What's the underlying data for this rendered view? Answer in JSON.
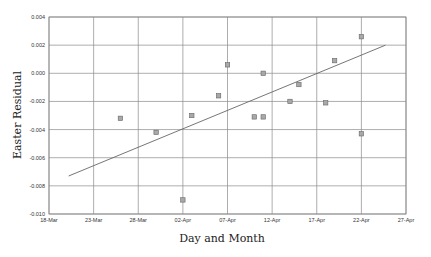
{
  "chart_data": {
    "type": "scatter",
    "title": "",
    "xlabel": "Day and Month",
    "ylabel": "Easter Residual",
    "x_tick_labels": [
      "18-Mar",
      "23-Mar",
      "28-Mar",
      "02-Apr",
      "07-Apr",
      "12-Apr",
      "17-Apr",
      "22-Apr",
      "27-Apr"
    ],
    "y_tick_labels": [
      "0.004",
      "0.002",
      "0.000",
      "-0.002",
      "-0.004",
      "-0.006",
      "-0.008",
      "-0.010"
    ],
    "ylim": [
      -0.01,
      0.004
    ],
    "xlim_days_from_18_mar": [
      0,
      40
    ],
    "grid": true,
    "legend": null,
    "series": [
      {
        "name": "Easter residuals",
        "kind": "points",
        "marker": "square",
        "points": [
          {
            "date": "26-Mar",
            "day": 8,
            "y": -0.0032
          },
          {
            "date": "30-Mar",
            "day": 12,
            "y": -0.0042
          },
          {
            "date": "02-Apr",
            "day": 15,
            "y": -0.009
          },
          {
            "date": "03-Apr",
            "day": 16,
            "y": -0.003
          },
          {
            "date": "06-Apr",
            "day": 19,
            "y": -0.0016
          },
          {
            "date": "07-Apr",
            "day": 20,
            "y": 0.0006
          },
          {
            "date": "10-Apr",
            "day": 23,
            "y": -0.0031
          },
          {
            "date": "11-Apr",
            "day": 24,
            "y": -0.0031
          },
          {
            "date": "11-Apr",
            "day": 24,
            "y": 0.0
          },
          {
            "date": "14-Apr",
            "day": 27,
            "y": -0.002
          },
          {
            "date": "15-Apr",
            "day": 28,
            "y": -0.0008
          },
          {
            "date": "18-Apr",
            "day": 31,
            "y": -0.0021
          },
          {
            "date": "19-Apr",
            "day": 32,
            "y": 0.0009
          },
          {
            "date": "22-Apr",
            "day": 35,
            "y": 0.0026
          },
          {
            "date": "22-Apr",
            "day": 35,
            "y": -0.0043
          }
        ]
      },
      {
        "name": "Fitted trend",
        "kind": "line",
        "points": [
          {
            "day": 2.2,
            "y": -0.0073
          },
          {
            "day": 37.7,
            "y": 0.002
          }
        ]
      }
    ]
  }
}
